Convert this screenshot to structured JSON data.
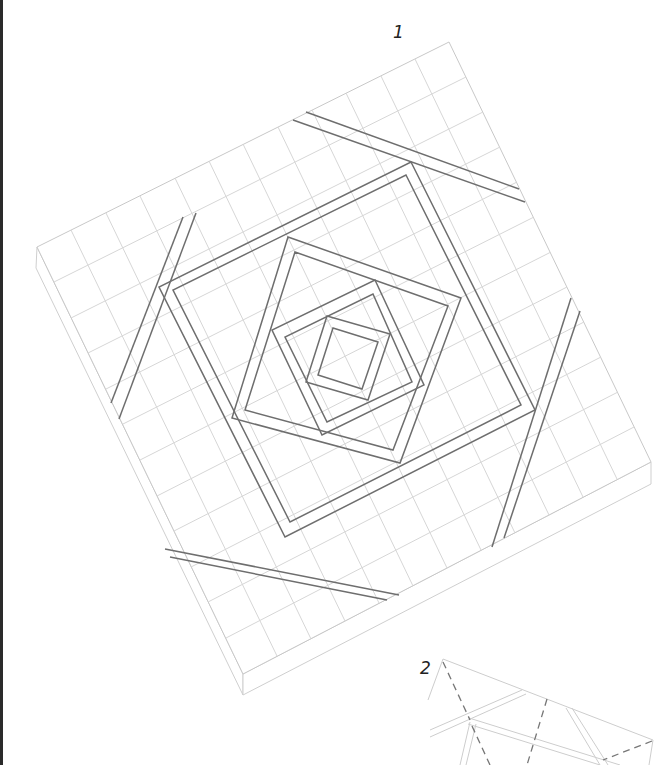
{
  "figures": [
    {
      "id": "1",
      "label": "1",
      "description": "Grid tile with concentric twisted squares and four edge stripes"
    },
    {
      "id": "2",
      "label": "2",
      "description": "Partial folding diagram with dashed fold lines"
    }
  ],
  "colors": {
    "grid": "#d4d4d4",
    "tile_edge": "#c8c8c8",
    "stroke": "#6e6e6e",
    "dashed": "#777777",
    "left_rule": "#2a2a2a"
  }
}
